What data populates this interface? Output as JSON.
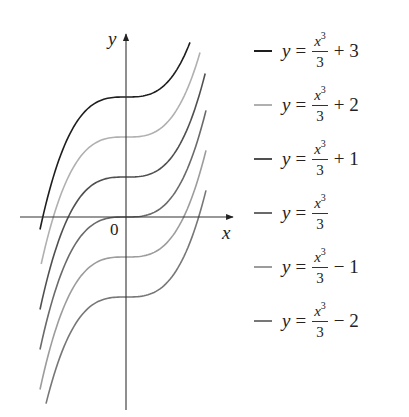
{
  "chart_data": {
    "type": "line",
    "title": "",
    "xlabel": "x",
    "ylabel": "y",
    "origin_label": "0",
    "grid": false,
    "legend_position": "right",
    "xlim": [
      -2.2,
      2.2
    ],
    "ylim": [
      -4.8,
      4.6
    ],
    "series": [
      {
        "name": "y = x^3/3 + 3",
        "c": 3,
        "color": "#1e1e1e",
        "x_range": [
          -2.15,
          1.6
        ]
      },
      {
        "name": "y = x^3/3 + 2",
        "c": 2,
        "color": "#b0b0b0",
        "x_range": [
          -2.12,
          1.85
        ]
      },
      {
        "name": "y = x^3/3 + 1",
        "c": 1,
        "color": "#505050",
        "x_range": [
          -2.15,
          1.98
        ]
      },
      {
        "name": "y = x^3/3",
        "c": 0,
        "color": "#6a6a6a",
        "x_range": [
          -2.15,
          2.0
        ]
      },
      {
        "name": "y = x^3/3 - 1",
        "c": -1,
        "color": "#9c9c9c",
        "x_range": [
          -2.15,
          2.0
        ]
      },
      {
        "name": "y = x^3/3 - 2",
        "c": -2,
        "color": "#777777",
        "x_range": [
          -2.0,
          2.0
        ]
      }
    ]
  },
  "legend": {
    "items": [
      {
        "y": "y",
        "eq": "=",
        "num": "x",
        "exp": "3",
        "den": "3",
        "rest": "+ 3",
        "color": "#1e1e1e"
      },
      {
        "y": "y",
        "eq": "=",
        "num": "x",
        "exp": "3",
        "den": "3",
        "rest": "+ 2",
        "color": "#b0b0b0"
      },
      {
        "y": "y",
        "eq": "=",
        "num": "x",
        "exp": "3",
        "den": "3",
        "rest": "+ 1",
        "color": "#505050"
      },
      {
        "y": "y",
        "eq": "=",
        "num": "x",
        "exp": "3",
        "den": "3",
        "rest": "",
        "color": "#6a6a6a"
      },
      {
        "y": "y",
        "eq": "=",
        "num": "x",
        "exp": "3",
        "den": "3",
        "rest": "− 1",
        "color": "#9c9c9c"
      },
      {
        "y": "y",
        "eq": "=",
        "num": "x",
        "exp": "3",
        "den": "3",
        "rest": "− 2",
        "color": "#777777"
      }
    ]
  },
  "axes": {
    "x_label": "x",
    "y_label": "y",
    "origin": "0"
  }
}
